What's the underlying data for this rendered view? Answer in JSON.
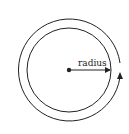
{
  "diagram": {
    "label": "radius",
    "center": {
      "x": 69,
      "y": 70
    },
    "inner_radius": 42,
    "outer_radius": 51,
    "colors": {
      "stroke": "#222222",
      "background": "#ffffff"
    },
    "elements": [
      "inner-circle",
      "outer-circle-with-gap",
      "center-dot",
      "radius-arrow",
      "upward-arrowhead"
    ]
  }
}
